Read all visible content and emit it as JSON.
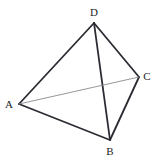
{
  "figure": {
    "kind": "geometry-diagram",
    "name": "tetrahedron-abcd",
    "background_color": "#ffffff",
    "canvas": {
      "width": 155,
      "height": 162
    },
    "label_color": "#222226",
    "solid_edge_color": "#2b2b33",
    "hidden_edge_color": "#8a8a90",
    "solid_edge_width": 1.8,
    "hidden_edge_width": 0.9,
    "vertices": [
      {
        "id": "A",
        "label": "A",
        "x": 19,
        "y": 104,
        "label_x": 9,
        "label_y": 104
      },
      {
        "id": "B",
        "label": "B",
        "x": 110,
        "y": 140,
        "label_x": 110,
        "label_y": 151
      },
      {
        "id": "C",
        "label": "C",
        "x": 139,
        "y": 77,
        "label_x": 147,
        "label_y": 76
      },
      {
        "id": "D",
        "label": "D",
        "x": 94,
        "y": 23,
        "label_x": 94,
        "label_y": 12
      }
    ],
    "edges": [
      {
        "id": "AD",
        "from": "A",
        "to": "D",
        "style": "solid"
      },
      {
        "id": "DC",
        "from": "D",
        "to": "C",
        "style": "solid"
      },
      {
        "id": "DB",
        "from": "D",
        "to": "B",
        "style": "solid"
      },
      {
        "id": "AB",
        "from": "A",
        "to": "B",
        "style": "solid"
      },
      {
        "id": "BC",
        "from": "B",
        "to": "C",
        "style": "solid"
      },
      {
        "id": "AC",
        "from": "A",
        "to": "C",
        "style": "hidden"
      }
    ]
  }
}
